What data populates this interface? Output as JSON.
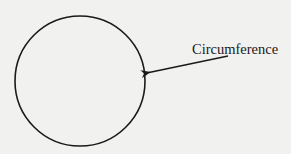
{
  "diagram": {
    "label": "Circumference",
    "colors": {
      "background": "#f1f1f0",
      "stroke": "#1a1a1a"
    },
    "circle": {
      "cx": 80,
      "cy": 81,
      "r": 65
    },
    "arrow": {
      "from": [
        228,
        56
      ],
      "to": [
        147,
        73
      ]
    }
  }
}
